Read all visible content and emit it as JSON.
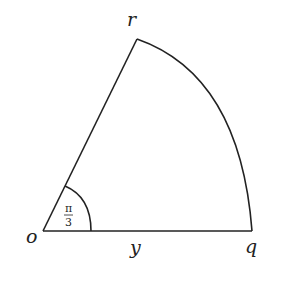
{
  "figure": {
    "type": "sector",
    "labels": {
      "origin": "o",
      "top_point": "r",
      "right_point": "q",
      "radius_label": "y"
    },
    "angle": {
      "numerator": "π",
      "denominator": "3"
    },
    "stroke_color": "#222222",
    "background": "#ffffff"
  }
}
